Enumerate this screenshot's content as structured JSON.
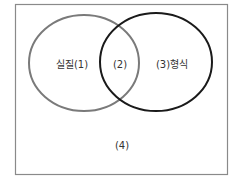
{
  "diagram": {
    "type": "venn",
    "frame": {
      "x": 15,
      "y": 4,
      "width": 213,
      "height": 171,
      "stroke": "#8a8a8a"
    },
    "sets": [
      {
        "id": "left",
        "cx": 84,
        "cy": 63,
        "rx": 55,
        "ry": 48,
        "stroke": "#7a7a7a"
      },
      {
        "id": "right",
        "cx": 156,
        "cy": 62,
        "rx": 56,
        "ry": 49,
        "stroke": "#1a1a1a"
      }
    ],
    "labels": {
      "left_only": "실질(1)",
      "intersection": "(2)",
      "right_only": "(3)형식",
      "outside": "(4)"
    }
  }
}
